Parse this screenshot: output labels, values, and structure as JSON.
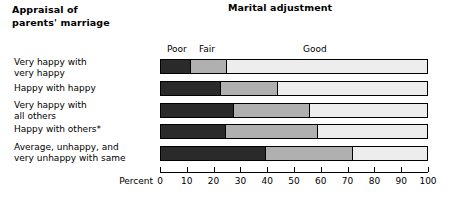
{
  "headings": {
    "left": "Appraisal of\nparents' marriage",
    "right": "Marital adjustment"
  },
  "axis": {
    "title": "Percent",
    "ticks": [
      0,
      10,
      20,
      30,
      40,
      50,
      60,
      70,
      80,
      90,
      100
    ],
    "min": 0,
    "max": 100
  },
  "segment_labels": {
    "poor": "Poor",
    "fair": "Fair",
    "good": "Good"
  },
  "colors": {
    "poor": "#2a2a2a",
    "fair": "#b0b0b0",
    "good": "#ededed",
    "outline": "#000000"
  },
  "rows": [
    {
      "label": "Very happy with\nvery happy"
    },
    {
      "label": "Happy with happy"
    },
    {
      "label": "Very happy with\nall others"
    },
    {
      "label": "Happy with others*"
    },
    {
      "label": "Average, unhappy, and\nvery unhappy with same"
    }
  ],
  "chart_data": {
    "type": "bar",
    "orientation": "horizontal",
    "stacked": true,
    "title": "Marital adjustment",
    "xlabel": "Percent",
    "ylabel": "Appraisal of parents' marriage",
    "xlim": [
      0,
      100
    ],
    "xticks": [
      0,
      10,
      20,
      30,
      40,
      50,
      60,
      70,
      80,
      90,
      100
    ],
    "grid": false,
    "legend": [
      "Poor",
      "Fair",
      "Good"
    ],
    "legend_position": "above-first-bar",
    "categories": [
      "Very happy with very happy",
      "Happy with happy",
      "Very happy with all others",
      "Happy with others*",
      "Average, unhappy, and very unhappy with same"
    ],
    "series": [
      {
        "name": "Poor",
        "values": [
          11,
          22,
          27,
          24,
          39
        ]
      },
      {
        "name": "Fair",
        "values": [
          14,
          22,
          29,
          35,
          33
        ]
      },
      {
        "name": "Good",
        "values": [
          75,
          56,
          44,
          41,
          28
        ]
      }
    ],
    "cumulative_boundaries": [
      [
        11,
        25
      ],
      [
        22,
        44
      ],
      [
        27,
        56
      ],
      [
        24,
        59
      ],
      [
        39,
        72
      ]
    ]
  }
}
